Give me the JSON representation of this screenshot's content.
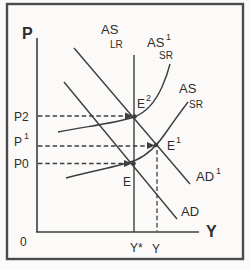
{
  "colors": {
    "background": "#fbfaf8",
    "frame": "#4b4b4b",
    "ink": "#3e3e3e",
    "text": "#2d2d2d"
  },
  "axes": {
    "vertical_axis_label": "P",
    "horizontal_axis_label": "Y",
    "origin_label": "0"
  },
  "price_levels": {
    "p2": "P2",
    "p1": {
      "base": "P",
      "sup": "1"
    },
    "p0": "P0"
  },
  "output_levels": {
    "y_star": "Y*",
    "y": "Y"
  },
  "curves": {
    "as_lr": {
      "base": "AS",
      "sub": "LR"
    },
    "as_sr_shifted": {
      "base": "AS",
      "sup": "1",
      "sub": "SR"
    },
    "as_sr": {
      "base": "AS",
      "sub": "SR"
    },
    "ad_shifted": {
      "base": "AD",
      "sup": "1"
    },
    "ad": {
      "base": "AD"
    }
  },
  "equilibria": {
    "e2": {
      "base": "E",
      "sup": "2"
    },
    "e1": {
      "base": "E",
      "sup": "1"
    },
    "e": {
      "base": "E"
    }
  }
}
